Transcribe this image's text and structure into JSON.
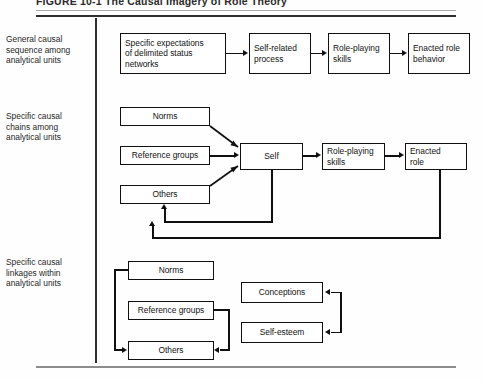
{
  "figure": {
    "title": "FIGURE 10-1   The Causal Imagery of Role Theory",
    "width": 485,
    "height": 381,
    "line_color": "#101010",
    "background": "#ffffff",
    "rule_color": "#2e2e2e"
  },
  "rows": [
    {
      "id": "general",
      "label": "General causal\nsequence among\nanalytical units"
    },
    {
      "id": "chains",
      "label": "Specific causal\nchains among\nanalytical units"
    },
    {
      "id": "linkages",
      "label": "Specific causal\nlinkages within\nanalytical units"
    }
  ],
  "nodes": {
    "r1n1": "Specific expectations\nof delimited status\nnetworks",
    "r1n2": "Self-related\nprocess",
    "r1n3": "Role-playing\nskills",
    "r1n4": "Enacted role\nbehavior",
    "r2norms": "Norms",
    "r2refgroups": "Reference groups",
    "r2others": "Others",
    "r2self": "Self",
    "r2skills": "Role-playing\nskills",
    "r2enacted": "Enacted\nrole",
    "r3norms": "Norms",
    "r3refgroups": "Reference groups",
    "r3others": "Others",
    "r3conceptions": "Conceptions",
    "r3selfesteem": "Self-esteem"
  }
}
